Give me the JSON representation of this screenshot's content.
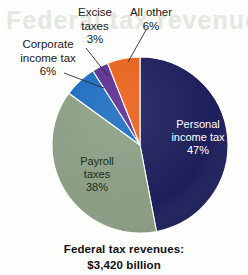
{
  "background_artifact": {
    "ghost_text": "Federal tax revenues"
  },
  "caption": {
    "line1": "Federal tax revenues:",
    "line2": "$3,420 billion"
  },
  "chart_data": {
    "type": "pie",
    "title": "Federal tax revenues: $3,420 billion",
    "total_label": "$3,420 billion",
    "total_value": 3420,
    "units": "billions of dollars",
    "xlabel": "",
    "ylabel": "",
    "legend": "none",
    "grid": false,
    "start_angle_deg": 0,
    "direction": "clockwise",
    "categories": [
      "Personal income tax",
      "Payroll taxes",
      "Corporate income tax",
      "Excise taxes",
      "All other"
    ],
    "values": [
      47,
      38,
      6,
      3,
      6
    ],
    "value_labels": [
      "47%",
      "38%",
      "6%",
      "3%",
      "6%"
    ],
    "colors": [
      "#1d1f5c",
      "#8a9e84",
      "#1c6cc0",
      "#5b2d91",
      "#e8621a"
    ],
    "slices": [
      {
        "name": "Personal income tax",
        "label_line1": "Personal",
        "label_line2": "income tax",
        "value": 47,
        "value_label": "47%",
        "color": "#1d1f5c",
        "label_placement": "inside",
        "label_color": "#ffffff"
      },
      {
        "name": "Payroll taxes",
        "label_line1": "Payroll",
        "label_line2": "taxes",
        "value": 38,
        "value_label": "38%",
        "color": "#8a9e84",
        "label_placement": "inside",
        "label_color": "#1c2a20"
      },
      {
        "name": "Corporate income tax",
        "label_line1": "Corporate",
        "label_line2": "income tax",
        "value": 6,
        "value_label": "6%",
        "color": "#1c6cc0",
        "label_placement": "outside",
        "label_color": "#1a1a1a"
      },
      {
        "name": "Excise taxes",
        "label_line1": "Excise",
        "label_line2": "taxes",
        "value": 3,
        "value_label": "3%",
        "color": "#5b2d91",
        "label_placement": "outside",
        "label_color": "#1a1a1a"
      },
      {
        "name": "All other",
        "label_line1": "All other",
        "label_line2": "",
        "value": 6,
        "value_label": "6%",
        "color": "#e8621a",
        "label_placement": "outside",
        "label_color": "#1a1a1a"
      }
    ]
  }
}
